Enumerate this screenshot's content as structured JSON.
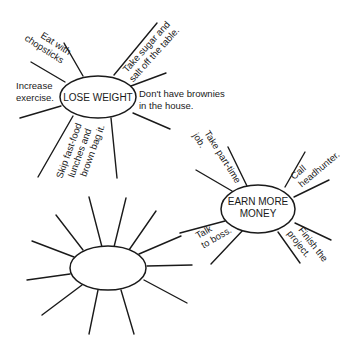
{
  "diagram": {
    "type": "mind-map / goal web",
    "clusters": [
      {
        "id": "lose-weight",
        "center_label": [
          "LOSE WEIGHT"
        ],
        "branches": [
          {
            "label": [
              "Eat with",
              "chopsticks"
            ]
          },
          {
            "label": [
              "Increase",
              "exercise."
            ]
          },
          {
            "label": [
              "Take sugar and",
              "salt off the table."
            ]
          },
          {
            "label": [
              "Don't have brownies",
              "in the house."
            ]
          },
          {
            "label": [
              "Skip fast-food",
              "lunches and",
              "brown bag it."
            ]
          }
        ]
      },
      {
        "id": "earn-more-money",
        "center_label": [
          "EARN MORE",
          "MONEY"
        ],
        "branches": [
          {
            "label": [
              "Take part-time",
              "job."
            ]
          },
          {
            "label": [
              "Call",
              "headhunter."
            ]
          },
          {
            "label": [
              "Talk",
              "to boss."
            ]
          },
          {
            "label": [
              "Finish the",
              "project."
            ]
          }
        ]
      },
      {
        "id": "blank-goal",
        "center_label": [],
        "branches": []
      }
    ],
    "colors": {
      "ink": "#1a1a1a",
      "background": "#ffffff"
    }
  }
}
